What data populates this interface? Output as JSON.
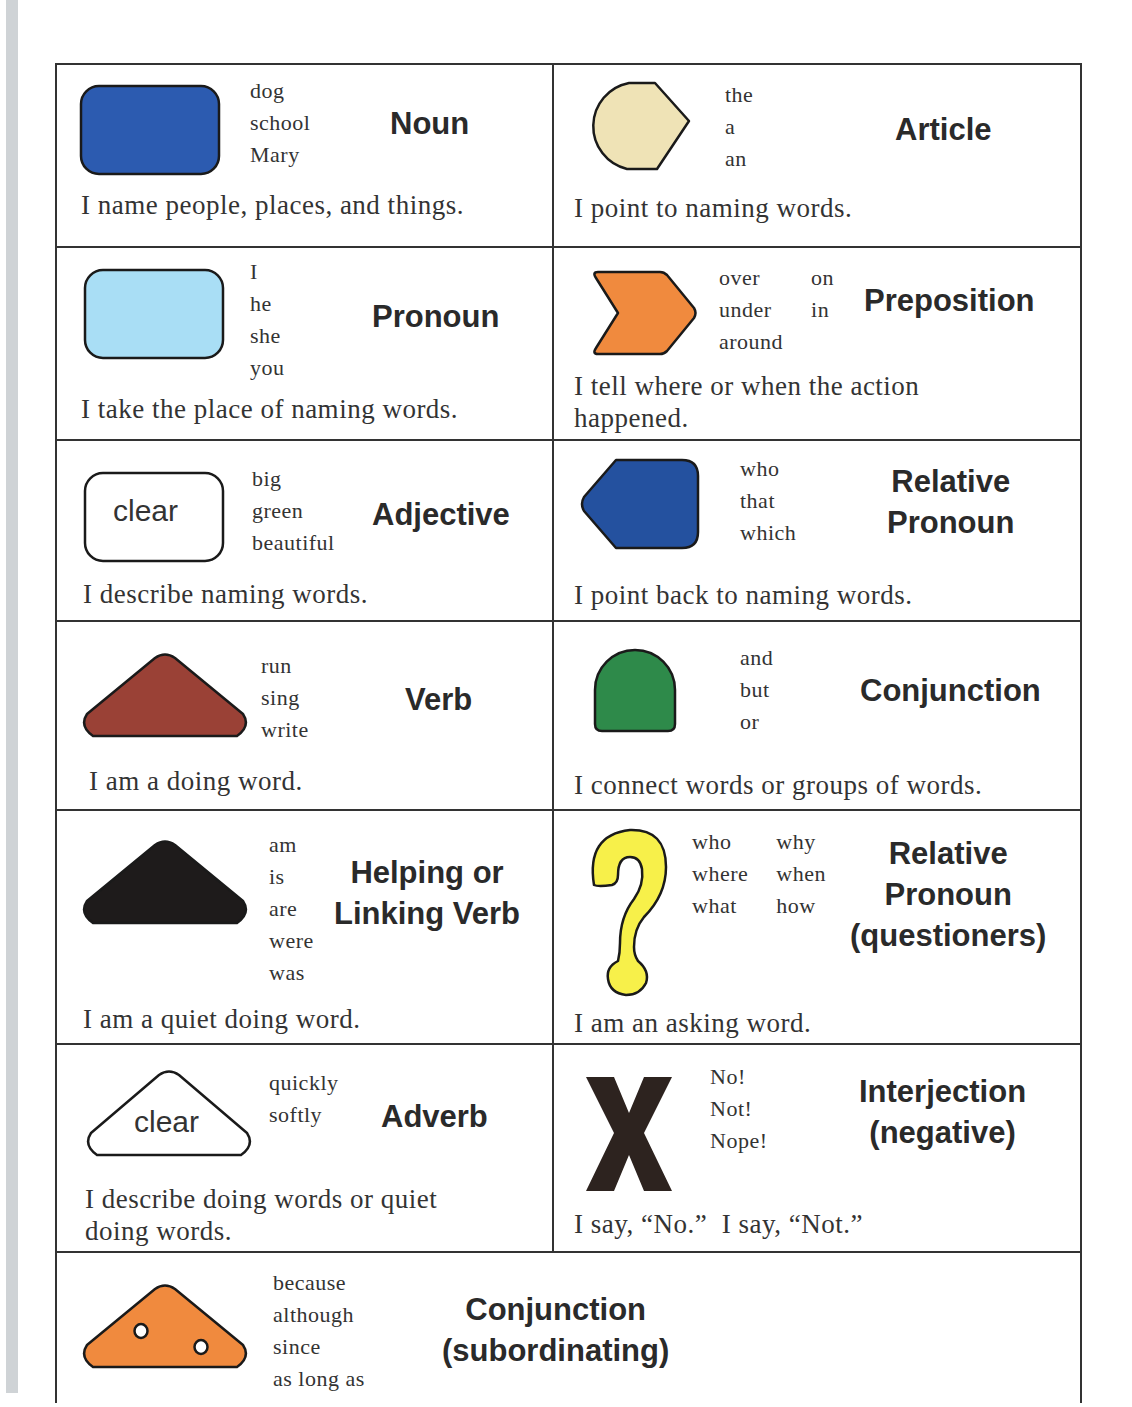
{
  "colors": {
    "noun": "#2c5bb0",
    "article": "#efe3b6",
    "pronoun": "#a9def5",
    "preposition": "#f08a3e",
    "relative_pronoun": "#24519f",
    "verb": "#9a4136",
    "conjunction": "#2e8a4a",
    "helping_verb": "#1e1b1b",
    "questioner": "#f7f04a",
    "interjection": "#2d231f",
    "subordinating": "#f08a3e",
    "border": "#333333"
  },
  "cards": {
    "noun": {
      "icon": "rounded-rectangle-dark-blue",
      "title": "Noun",
      "examples": [
        "dog",
        "school",
        "Mary"
      ],
      "description": "I name people, places, and things."
    },
    "article": {
      "icon": "pointed-circle-tan",
      "title": "Article",
      "examples": [
        "the",
        "a",
        "an"
      ],
      "description": "I point to naming words."
    },
    "pronoun": {
      "icon": "rounded-rectangle-light-blue",
      "title": "Pronoun",
      "examples": [
        "I",
        "he",
        "she",
        "you"
      ],
      "description": "I take the place of naming words."
    },
    "preposition": {
      "icon": "chevron-orange",
      "title": "Preposition",
      "examples": [
        "over",
        "on",
        "under",
        "in",
        "around"
      ],
      "description_line1": "I tell where or when the action",
      "description_line2": "happened."
    },
    "adjective": {
      "icon": "rounded-rectangle-clear",
      "icon_label": "clear",
      "title": "Adjective",
      "examples": [
        "big",
        "green",
        "beautiful"
      ],
      "description": "I describe naming words."
    },
    "relative_pronoun": {
      "icon": "left-pointed-pentagon-blue",
      "title_line1": "Relative",
      "title_line2": "Pronoun",
      "examples": [
        "who",
        "that",
        "which"
      ],
      "description": "I point back to naming words."
    },
    "verb": {
      "icon": "triangle-brown",
      "title": "Verb",
      "examples": [
        "run",
        "sing",
        "write"
      ],
      "description": "I am a doing word."
    },
    "conjunction": {
      "icon": "arch-green",
      "title": "Conjunction",
      "examples": [
        "and",
        "but",
        "or"
      ],
      "description": "I connect words or groups of words."
    },
    "helping_verb": {
      "icon": "triangle-black",
      "title_line1": "Helping or",
      "title_line2": "Linking Verb",
      "examples": [
        "am",
        "is",
        "are",
        "were",
        "was"
      ],
      "description": "I am a quiet doing word."
    },
    "questioners": {
      "icon": "question-mark-yellow",
      "title_line1": "Relative",
      "title_line2": "Pronoun",
      "title_line3": "(questioners)",
      "examples": [
        "who",
        "why",
        "where",
        "when",
        "what",
        "how"
      ],
      "description": "I am an asking word."
    },
    "adverb": {
      "icon": "triangle-clear",
      "icon_label": "clear",
      "title": "Adverb",
      "examples": [
        "quickly",
        "softly"
      ],
      "description_line1": "I describe doing words or quiet",
      "description_line2": "doing words."
    },
    "interjection": {
      "icon": "x-mark-dark-brown",
      "title_line1": "Interjection",
      "title_line2": "(negative)",
      "examples": [
        "No!",
        "Not!",
        "Nope!"
      ],
      "description": "I say, “No.”  I say, “Not.”"
    },
    "subordinating": {
      "icon": "triangle-orange-with-holes",
      "title_line1": "Conjunction",
      "title_line2": "(subordinating)",
      "examples": [
        "because",
        "although",
        "since",
        "as long as"
      ]
    }
  }
}
